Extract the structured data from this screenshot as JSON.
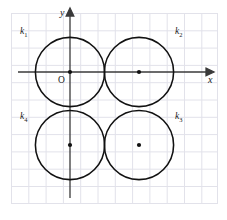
{
  "figure": {
    "name": "four-tangent-circles-coordinate-plane",
    "colors": {
      "grid": "#e2e2ea",
      "axis": "#3a3a3a",
      "circle": "#111111",
      "dot": "#111111",
      "text": "#1a1a1a",
      "background": "#ffffff"
    },
    "grid": {
      "visible": true,
      "spacing_px": 17.3,
      "x_start_px": 11,
      "y_start_px": 13,
      "x_end_px": 218,
      "y_end_px": 204
    },
    "axes": {
      "x_label": "x",
      "y_label": "y",
      "origin_label": "O",
      "x_axis_y_px": 72,
      "y_axis_x_px": 70,
      "arrowheads": true
    },
    "circles": [
      {
        "label": "k",
        "subscript": "1",
        "center_px": [
          70,
          72
        ],
        "center_units": [
          0,
          0
        ],
        "radius_px": 34.6,
        "radius_units": 2,
        "label_pos_px": [
          22,
          27
        ],
        "center_dot": true
      },
      {
        "label": "k",
        "subscript": "2",
        "center_px": [
          139,
          72
        ],
        "center_units": [
          4,
          0
        ],
        "radius_px": 34.6,
        "radius_units": 2,
        "label_pos_px": [
          176,
          27
        ],
        "center_dot": true
      },
      {
        "label": "k",
        "subscript": "3",
        "center_px": [
          139,
          145
        ],
        "center_units": [
          4,
          -4
        ],
        "radius_px": 34.6,
        "radius_units": 2,
        "label_pos_px": [
          176,
          112
        ],
        "center_dot": true
      },
      {
        "label": "k",
        "subscript": "4",
        "center_px": [
          70,
          145
        ],
        "center_units": [
          0,
          -4
        ],
        "radius_px": 34.6,
        "radius_units": 2,
        "label_pos_px": [
          22,
          112
        ],
        "center_dot": true
      }
    ]
  },
  "labels": {
    "k1": "k",
    "k1_sub": "1",
    "k2": "k",
    "k2_sub": "2",
    "k3": "k",
    "k3_sub": "3",
    "k4": "k",
    "k4_sub": "4",
    "x_axis": "x",
    "y_axis": "y",
    "origin": "O"
  }
}
